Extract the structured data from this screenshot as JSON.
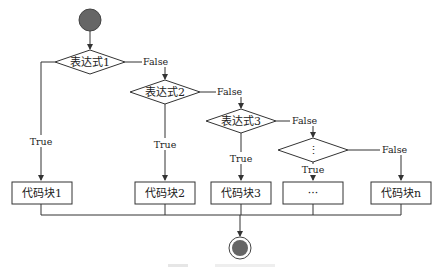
{
  "diagram": {
    "type": "flowchart",
    "start_node": {
      "shape": "filled-circle",
      "color": "#666666"
    },
    "end_node": {
      "shape": "double-circle",
      "color": "#666666"
    },
    "decisions": [
      {
        "id": "d1",
        "label": "表达式1",
        "true_label": "True",
        "false_label": "False"
      },
      {
        "id": "d2",
        "label": "表达式2",
        "true_label": "True",
        "false_label": "False"
      },
      {
        "id": "d3",
        "label": "表达式3",
        "true_label": "True",
        "false_label": "False"
      },
      {
        "id": "d4",
        "label": "⋮",
        "true_label": "True",
        "false_label": "False"
      }
    ],
    "blocks": [
      {
        "id": "b1",
        "label": "代码块1"
      },
      {
        "id": "b2",
        "label": "代码块2"
      },
      {
        "id": "b3",
        "label": "代码块3"
      },
      {
        "id": "b4",
        "label": "···"
      },
      {
        "id": "bn",
        "label": "代码块n"
      }
    ],
    "line_color": "#333333"
  }
}
